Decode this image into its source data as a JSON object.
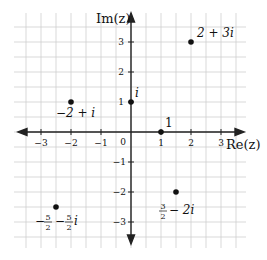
{
  "diagram": {
    "type": "complex-plane",
    "x_axis": {
      "label": "Re(z)",
      "ticks": [
        "−3",
        "−2",
        "−1",
        "1",
        "2",
        "3"
      ],
      "range": [
        -3.5,
        3.5
      ]
    },
    "y_axis": {
      "label": "Im(z)",
      "ticks": [
        "3",
        "2",
        "1",
        "−1",
        "−2",
        "−3"
      ],
      "range": [
        -3.5,
        3.5
      ]
    },
    "origin_label": "0",
    "grid": {
      "spacing": 0.5,
      "color": "#cfcfcf"
    },
    "colors": {
      "axis": "#222222",
      "point": "#111111",
      "grid": "#cfcfcf"
    },
    "points": [
      {
        "name": "2+3i",
        "re": 2,
        "im": 3,
        "label": "2 + 3i"
      },
      {
        "name": "-2+i",
        "re": -2,
        "im": 1,
        "label": "−2 + i"
      },
      {
        "name": "i",
        "re": 0,
        "im": 1,
        "label": "i"
      },
      {
        "name": "1",
        "re": 1,
        "im": 0,
        "label": "1"
      },
      {
        "name": "3/2-2i",
        "re": 1.5,
        "im": -2,
        "label_frac_num": "3",
        "label_frac_den": "2",
        "label_rest": "− 2i"
      },
      {
        "name": "-5/2-5/2i",
        "re": -2.5,
        "im": -2.5,
        "label_pre": "−",
        "label_frac1_num": "5",
        "label_frac1_den": "2",
        "label_mid": "−",
        "label_frac2_num": "5",
        "label_frac2_den": "2",
        "label_rest": "i"
      }
    ]
  }
}
